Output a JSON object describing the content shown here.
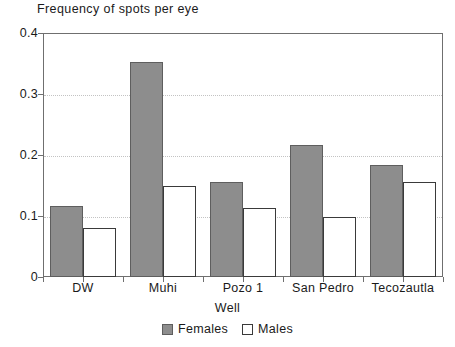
{
  "chart_data": {
    "type": "bar",
    "title": "Frequency of spots per eye",
    "xlabel": "Well",
    "ylabel": "",
    "categories": [
      "DW",
      "Muhi",
      "Pozo 1",
      "San Pedro",
      "Tecozautla"
    ],
    "series": [
      {
        "name": "Females",
        "color": "#8d8d8d",
        "values": [
          0.117,
          0.352,
          0.156,
          0.217,
          0.184
        ]
      },
      {
        "name": "Males",
        "color": "#ffffff",
        "values": [
          0.08,
          0.15,
          0.113,
          0.099,
          0.156
        ]
      }
    ],
    "ylim": [
      0,
      0.4
    ],
    "yticks": [
      0,
      0.1,
      0.2,
      0.3,
      0.4
    ],
    "ytick_labels": [
      "0",
      "0.1",
      "0.2",
      "0.3",
      "0.4"
    ],
    "grid": "horizontal-dotted",
    "legend_position": "bottom-center"
  },
  "legend": {
    "entries": [
      {
        "label": "Females",
        "swatch": "filled-gray-square"
      },
      {
        "label": "Males",
        "swatch": "open-white-square"
      }
    ]
  }
}
